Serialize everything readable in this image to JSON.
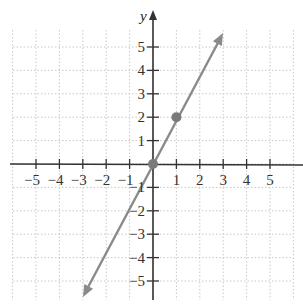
{
  "chart_data": {
    "type": "line",
    "title": "",
    "xlabel": "",
    "ylabel": "y",
    "xlim": [
      -6,
      6
    ],
    "ylim": [
      -6,
      6
    ],
    "grid": true,
    "x_ticks": [
      -5,
      -4,
      -3,
      -2,
      -1,
      1,
      2,
      3,
      4,
      5
    ],
    "y_ticks": [
      -5,
      -4,
      -3,
      -2,
      -1,
      1,
      2,
      3,
      4,
      5
    ],
    "x_tick_labels": [
      "−5",
      "−4",
      "−3",
      "−2",
      "−1",
      "1",
      "2",
      "3",
      "4",
      "5"
    ],
    "y_tick_labels": [
      "−5",
      "−4",
      "−3",
      "−2",
      "−1",
      "1",
      "2",
      "3",
      "4",
      "5"
    ],
    "series": [
      {
        "name": "y = 2x",
        "type": "line",
        "x": [
          -3,
          3
        ],
        "y": [
          -6,
          6
        ],
        "arrows": "both",
        "color": "#8a8a8a"
      },
      {
        "name": "points",
        "type": "scatter",
        "x": [
          0,
          1
        ],
        "y": [
          0,
          2
        ],
        "color": "#7a7a7a"
      }
    ]
  },
  "colors": {
    "axis": "#333333",
    "grid": "#c8c8c8",
    "line": "#8a8a8a",
    "point": "#7a7a7a"
  }
}
